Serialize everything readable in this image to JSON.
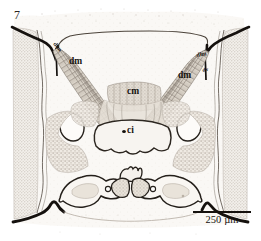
{
  "figure": {
    "number": "7",
    "caption_absent": true
  },
  "annotations": {
    "dm_left": "dm",
    "dm_right": "dm",
    "cm": "cm",
    "ci": "ci",
    "tiny_left": "dlm",
    "tiny_right": "dlm",
    "tiny_right_2": "dv"
  },
  "scalebar": {
    "label": "250 µm",
    "value": "250",
    "unit": "µm",
    "length_px": "58"
  },
  "colors": {
    "cuticle_dark": "#15110e",
    "outline": "#3b332c",
    "muscle_fill": "#c9c0b6",
    "muscle_stripe": "#8e857b",
    "eye_stipple": "#bdb7af",
    "tissue_light": "#f4f1ec",
    "tissue_mid": "#ded7cd",
    "background": "#ffffff",
    "text": "#17130f"
  },
  "structures": {
    "dorsal_muscles": "dm",
    "central_muscle": "cm",
    "central_ganglion": "ci",
    "lateral_eye_left": "compound-eye-left",
    "lateral_eye_right": "compound-eye-right",
    "mouthparts": "mandible-maxilla-complex"
  }
}
